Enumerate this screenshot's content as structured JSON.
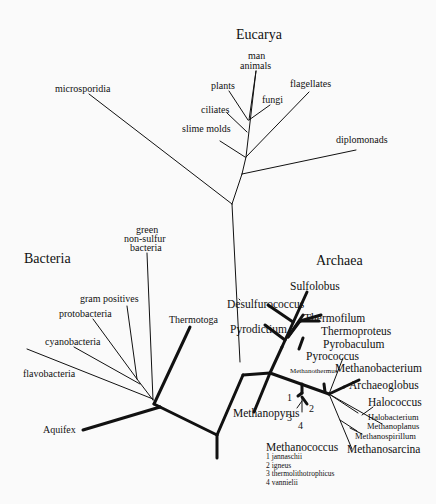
{
  "domains": {
    "eucarya": "Eucarya",
    "bacteria": "Bacteria",
    "archaea": "Archaea"
  },
  "eucarya": {
    "man": "man",
    "animals": "animals",
    "plants": "plants",
    "fungi": "fungi",
    "ciliates": "ciliates",
    "flagellates": "flagellates",
    "slime_molds": "slime molds",
    "microsporidia": "microsporidia",
    "diplomonads": "diplomonads"
  },
  "bacteria": {
    "green_1": "green",
    "green_2": "non-sulfur",
    "green_3": "bacteria",
    "gram_positives": "gram positives",
    "protobacteria": "protobacteria",
    "cyanobacteria": "cyanobacteria",
    "flavobacteria": "flavobacteria",
    "thermotoga": "Thermotoga",
    "aquifex": "Aquifex"
  },
  "archaea": {
    "sulfolobus": "Sulfolobus",
    "desulfurococcus": "Desulfurococcus",
    "pyrodictium": "Pyrodictium",
    "thermofilum": "Thermofilum",
    "thermoproteus": "Thermoproteus",
    "pyrobaculum": "Pyrobaculum",
    "pyrococcus": "Pyrococcus",
    "methanothermus": "Methanothermus",
    "methanobacterium": "Methanobacterium",
    "archaeoglobus": "Archaeoglobus",
    "halococcus": "Halococcus",
    "halobacterium": "Halobacterium",
    "methanoplanus": "Methanoplanus",
    "methanospirillum": "Methanospirillum",
    "methanosarcina": "Methanosarcina",
    "methanopyrus": "Methanopyrus",
    "num1": "1",
    "num2": "2",
    "num3": "3",
    "num4": "4"
  },
  "legend": {
    "title": "Methanococcus",
    "items": [
      "1 jannaschii",
      "2 igneus",
      "3 thermolithotrophicus",
      "4 vannielii"
    ]
  }
}
